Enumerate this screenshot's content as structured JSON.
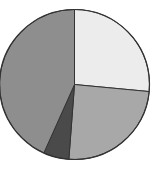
{
  "chart_data": {
    "type": "pie",
    "title": "",
    "labels": [
      "Slice A",
      "Slice B",
      "Slice C",
      "Slice D"
    ],
    "values": [
      26.5,
      24.7,
      5.5,
      43.3
    ],
    "colors": [
      "#ececec",
      "#a8a8a8",
      "#4a4a4a",
      "#8e8e8e"
    ],
    "start_angle_deg": 0,
    "direction": "clockwise",
    "legend": "none",
    "stroke_color": "#333333"
  },
  "geometry": {
    "cx": 74.5,
    "cy": 84.5,
    "r": 75
  }
}
